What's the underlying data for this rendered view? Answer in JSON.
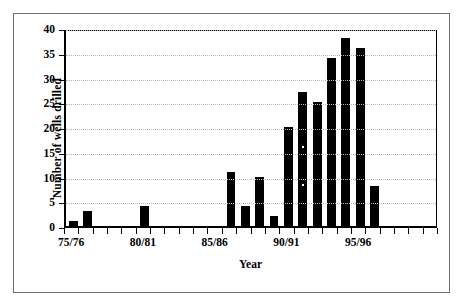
{
  "chart_data": {
    "type": "bar",
    "title": "",
    "xlabel": "Year",
    "ylabel": "Number of wells drilled",
    "ylim": [
      0,
      40
    ],
    "ytick_step": 5,
    "yticks": [
      0,
      5,
      10,
      15,
      20,
      25,
      30,
      35,
      40
    ],
    "grid": "horizontal-dotted",
    "legend": "none",
    "bar_color": "#000000",
    "categories": [
      "75/76",
      "76/77",
      "77/78",
      "78/79",
      "79/80",
      "80/81",
      "81/82",
      "82/83",
      "83/84",
      "84/85",
      "85/86",
      "86/87",
      "87/88",
      "88/89",
      "89/90",
      "90/91",
      "91/92",
      "92/93",
      "93/94",
      "94/95",
      "95/96",
      "96/97",
      "97/98",
      "98/99",
      "99/00",
      "00/01"
    ],
    "values": [
      1,
      3,
      0,
      0,
      0,
      4,
      0,
      0,
      0,
      0,
      0,
      11,
      4,
      10,
      2,
      20,
      27,
      25,
      34,
      38,
      36,
      8,
      0,
      0,
      0,
      0
    ],
    "visible_xtick_labels": [
      {
        "category": "75/76",
        "index": 0,
        "label": "75/76"
      },
      {
        "category": "80/81",
        "index": 5,
        "label": "80/81"
      },
      {
        "category": "85/86",
        "index": 10,
        "label": "85/86"
      },
      {
        "category": "90/91",
        "index": 15,
        "label": "90/91"
      },
      {
        "category": "95/96",
        "index": 20,
        "label": "95/96"
      }
    ]
  }
}
